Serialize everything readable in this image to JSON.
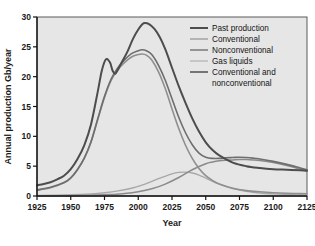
{
  "chart_data": {
    "type": "line",
    "title": "",
    "xlabel": "Year",
    "ylabel": "Annual production Gb/year",
    "xlim": [
      1925,
      2125
    ],
    "ylim": [
      0,
      30
    ],
    "xticks": [
      "1925",
      "1950",
      "1975",
      "2000",
      "2025",
      "2050",
      "2075",
      "2100",
      "2125"
    ],
    "yticks": [
      "0",
      "5",
      "10",
      "15",
      "20",
      "25",
      "30"
    ],
    "grid": false,
    "legend_position": "top-right",
    "series": [
      {
        "name": "Past production",
        "color": "#4d4d4d",
        "width": 2.0,
        "x": [
          1925,
          1930,
          1935,
          1940,
          1945,
          1950,
          1955,
          1960,
          1965,
          1970,
          1973,
          1976,
          1979,
          1981,
          1983,
          1985,
          1988,
          1992,
          1996,
          2000,
          2003,
          2005,
          2008,
          2012,
          2016,
          2020,
          2025,
          2030,
          2035,
          2040,
          2045,
          2050,
          2055,
          2060,
          2070,
          2080,
          2090,
          2100,
          2110,
          2120,
          2125
        ],
        "values": [
          1.8,
          2.0,
          2.3,
          2.8,
          3.4,
          4.5,
          6.2,
          8.5,
          12.0,
          17.5,
          21.0,
          22.9,
          22.4,
          21.0,
          20.5,
          21.2,
          22.5,
          24.2,
          26.3,
          27.9,
          28.8,
          29.0,
          28.8,
          28.0,
          26.6,
          24.6,
          21.5,
          18.4,
          15.6,
          13.0,
          10.8,
          9.0,
          7.7,
          6.8,
          5.6,
          5.0,
          4.7,
          4.5,
          4.4,
          4.3,
          4.25
        ]
      },
      {
        "name": "Conventional",
        "color": "#8f8f8f",
        "width": 1.6,
        "x": [
          1925,
          1935,
          1945,
          1950,
          1955,
          1960,
          1965,
          1970,
          1975,
          1980,
          1985,
          1990,
          1995,
          2000,
          2003,
          2006,
          2010,
          2015,
          2020,
          2025,
          2030,
          2035,
          2040,
          2045,
          2050,
          2055,
          2060,
          2070,
          2080,
          2090,
          2100,
          2110,
          2120,
          2125
        ],
        "values": [
          1.0,
          1.4,
          2.2,
          3.0,
          4.4,
          6.3,
          9.0,
          12.8,
          16.5,
          19.4,
          21.2,
          22.4,
          23.3,
          23.7,
          23.8,
          23.6,
          22.8,
          20.8,
          18.0,
          14.6,
          11.3,
          8.5,
          6.3,
          4.6,
          3.4,
          2.6,
          2.0,
          1.3,
          0.9,
          0.7,
          0.55,
          0.45,
          0.4,
          0.38
        ]
      },
      {
        "name": "Nonconventional",
        "color": "#8a8a8a",
        "width": 1.5,
        "x": [
          1925,
          1950,
          1970,
          1980,
          1990,
          2000,
          2010,
          2020,
          2030,
          2040,
          2050,
          2055,
          2060,
          2065,
          2070,
          2075,
          2080,
          2085,
          2090,
          2100,
          2110,
          2120,
          2125
        ],
        "values": [
          0.0,
          0.05,
          0.15,
          0.25,
          0.4,
          0.7,
          1.2,
          2.0,
          3.1,
          4.4,
          5.4,
          5.7,
          5.9,
          6.0,
          6.05,
          6.1,
          6.1,
          6.05,
          5.95,
          5.6,
          5.1,
          4.5,
          4.2
        ]
      },
      {
        "name": "Gas liquids",
        "color": "#a8a8a8",
        "width": 1.4,
        "x": [
          1925,
          1950,
          1965,
          1975,
          1985,
          1995,
          2005,
          2015,
          2025,
          2030,
          2035,
          2040,
          2045,
          2050,
          2060,
          2070,
          2080,
          2090,
          2100,
          2110,
          2120,
          2125
        ],
        "values": [
          0.1,
          0.2,
          0.35,
          0.55,
          0.85,
          1.3,
          2.0,
          2.9,
          3.7,
          3.95,
          4.0,
          3.85,
          3.5,
          3.0,
          2.0,
          1.25,
          0.8,
          0.5,
          0.35,
          0.25,
          0.18,
          0.15
        ]
      },
      {
        "name": "Conventional and nonconventional",
        "color": "#6e6e6e",
        "width": 1.6,
        "x": [
          1925,
          1935,
          1945,
          1950,
          1955,
          1960,
          1965,
          1970,
          1975,
          1980,
          1985,
          1990,
          1995,
          2000,
          2003,
          2006,
          2010,
          2015,
          2020,
          2025,
          2030,
          2035,
          2040,
          2045,
          2050,
          2055,
          2060,
          2065,
          2070,
          2075,
          2080,
          2085,
          2090,
          2100,
          2110,
          2120,
          2125
        ],
        "values": [
          1.0,
          1.45,
          2.25,
          3.05,
          4.45,
          6.35,
          9.1,
          12.95,
          16.7,
          19.65,
          21.55,
          22.85,
          23.85,
          24.35,
          24.5,
          24.35,
          23.7,
          21.9,
          19.4,
          16.3,
          13.2,
          10.6,
          8.6,
          7.2,
          6.5,
          6.3,
          6.3,
          6.4,
          6.45,
          6.5,
          6.45,
          6.35,
          6.2,
          5.8,
          5.3,
          4.7,
          4.4
        ]
      }
    ],
    "legend": [
      {
        "label": "Past production",
        "color": "#4d4d4d",
        "width": 2.0
      },
      {
        "label": "Conventional",
        "color": "#9a9a9a",
        "width": 1.3
      },
      {
        "label": "Nonconventional",
        "color": "#707070",
        "width": 1.4
      },
      {
        "label": "Gas liquids",
        "color": "#b0b0b0",
        "width": 1.2
      },
      {
        "label": "Conventional and",
        "label2": "nonconventional",
        "color": "#5a5a5a",
        "width": 1.6
      }
    ]
  }
}
